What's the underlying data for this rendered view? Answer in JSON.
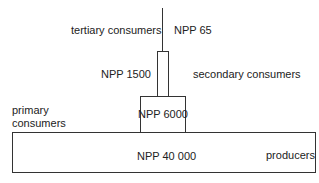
{
  "diagram": {
    "type": "pyramid of productivity",
    "levels": [
      {
        "level": "tertiary consumers",
        "npp_label": "NPP 65"
      },
      {
        "level": "secondary consumers",
        "npp_label": "NPP 1500"
      },
      {
        "level": "primary consumers",
        "level_lines": [
          "primary",
          "consumers"
        ],
        "npp_label": "NPP 6000"
      },
      {
        "level": "producers",
        "npp_label": "NPP 40 000"
      }
    ]
  }
}
